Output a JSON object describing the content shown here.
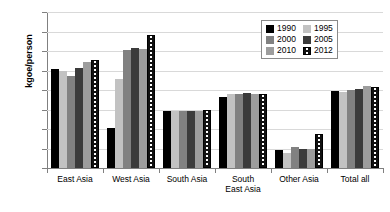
{
  "chart_data": {
    "type": "bar",
    "title": "",
    "xlabel": "",
    "ylabel": "kgoe/person",
    "ylim": [
      0,
      400
    ],
    "ytick_values": [
      0,
      50,
      100,
      150,
      200,
      250,
      300,
      350,
      400
    ],
    "ytick_labels": [
      "0",
      "50",
      "100",
      "150",
      "200",
      "250",
      "300",
      "350",
      "400"
    ],
    "grid": true,
    "legend_position": "upper-right",
    "categories": [
      "East Asia",
      "West Asia",
      "South Asia",
      "South\nEast Asia",
      "Other Asia",
      "Total all"
    ],
    "series": [
      {
        "name": "1990",
        "color": "#000000",
        "values": [
          255,
          103,
          146,
          181,
          45,
          197
        ]
      },
      {
        "name": "1995",
        "color": "#c2c2c2",
        "values": [
          248,
          228,
          145,
          190,
          38,
          196
        ]
      },
      {
        "name": "2000",
        "color": "#818181",
        "values": [
          236,
          302,
          147,
          191,
          53,
          199
        ]
      },
      {
        "name": "2005",
        "color": "#3b3b3b",
        "values": [
          256,
          309,
          146,
          192,
          50,
          203
        ]
      },
      {
        "name": "2010",
        "color": "#9d9d9d",
        "values": [
          271,
          305,
          147,
          190,
          49,
          210
        ]
      },
      {
        "name": "2012",
        "color": "#ffffff",
        "values": [
          278,
          341,
          149,
          191,
          88,
          208
        ]
      }
    ]
  },
  "legend": {
    "items": [
      {
        "label": "1990"
      },
      {
        "label": "1995"
      },
      {
        "label": "2000"
      },
      {
        "label": "2005"
      },
      {
        "label": "2010"
      },
      {
        "label": "2012"
      }
    ]
  }
}
